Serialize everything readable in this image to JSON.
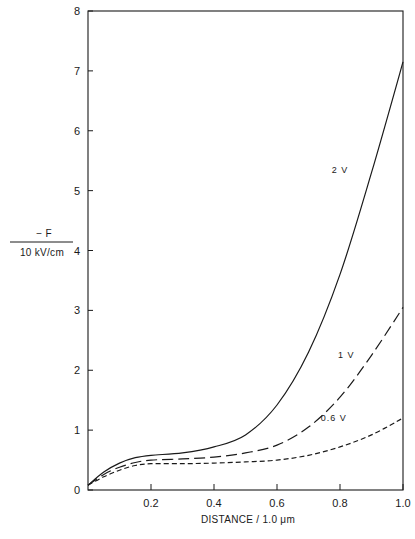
{
  "chart_data": {
    "type": "line",
    "title": "",
    "xlabel": "DISTANCE / 1.0 μm",
    "ylabel_numerator": "− F",
    "ylabel_denominator": "10 kV/cm",
    "xlim": [
      0,
      1.0
    ],
    "ylim": [
      0,
      8
    ],
    "grid": false,
    "legend": "inline labels",
    "x_ticks": [
      "0.2",
      "0.4",
      "0.6",
      "0.8",
      "1.0"
    ],
    "y_ticks": [
      "0",
      "1",
      "2",
      "3",
      "4",
      "5",
      "6",
      "7",
      "8"
    ],
    "x": [
      0.0,
      0.05,
      0.1,
      0.15,
      0.2,
      0.3,
      0.4,
      0.5,
      0.6,
      0.7,
      0.8,
      0.9,
      1.0
    ],
    "series": [
      {
        "name": "2 V",
        "style": "solid",
        "values": [
          0.08,
          0.3,
          0.45,
          0.54,
          0.58,
          0.62,
          0.72,
          0.92,
          1.42,
          2.3,
          3.6,
          5.3,
          7.15
        ]
      },
      {
        "name": "1 V",
        "style": "long-dash",
        "values": [
          0.08,
          0.26,
          0.38,
          0.46,
          0.5,
          0.52,
          0.55,
          0.62,
          0.75,
          1.05,
          1.55,
          2.25,
          3.05
        ]
      },
      {
        "name": "0.6 V",
        "style": "short-dash",
        "values": [
          0.08,
          0.22,
          0.33,
          0.41,
          0.44,
          0.44,
          0.45,
          0.47,
          0.5,
          0.58,
          0.72,
          0.92,
          1.2
        ]
      }
    ],
    "annotations": [
      {
        "text": "2 V",
        "x": 0.8,
        "y": 5.3
      },
      {
        "text": "1 V",
        "x": 0.82,
        "y": 2.2
      },
      {
        "text": "0.6 V",
        "x": 0.78,
        "y": 1.15
      }
    ]
  }
}
